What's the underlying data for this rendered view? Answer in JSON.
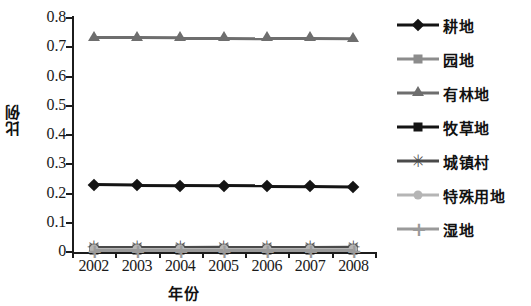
{
  "chart_data": {
    "type": "line",
    "title": "",
    "xlabel": "年份",
    "ylabel": "比例",
    "categories": [
      "2002",
      "2003",
      "2004",
      "2005",
      "2006",
      "2007",
      "2008"
    ],
    "x": [
      2002,
      2003,
      2004,
      2005,
      2006,
      2007,
      2008
    ],
    "ylim": [
      0,
      0.8
    ],
    "yticks": [
      "0",
      "0.1",
      "0.2",
      "0.3",
      "0.4",
      "0.5",
      "0.6",
      "0.7",
      "0.8"
    ],
    "ytick_values": [
      0,
      0.1,
      0.2,
      0.3,
      0.4,
      0.5,
      0.6,
      0.7,
      0.8
    ],
    "grid": false,
    "legend_position": "right",
    "series": [
      {
        "name": "耕地",
        "marker": "diamond",
        "color": "#141414",
        "line_color": "#141414",
        "values": [
          0.23,
          0.228,
          0.227,
          0.226,
          0.225,
          0.224,
          0.222
        ]
      },
      {
        "name": "园地",
        "marker": "square",
        "color": "#8c8c8c",
        "line_color": "#8c8c8c",
        "values": [
          0.012,
          0.012,
          0.012,
          0.012,
          0.012,
          0.012,
          0.012
        ]
      },
      {
        "name": "有林地",
        "marker": "triangle",
        "color": "#6e6e6e",
        "line_color": "#6e6e6e",
        "values": [
          0.732,
          0.732,
          0.731,
          0.731,
          0.73,
          0.73,
          0.729
        ]
      },
      {
        "name": "牧草地",
        "marker": "square",
        "color": "#141414",
        "line_color": "#141414",
        "values": [
          0.006,
          0.006,
          0.006,
          0.006,
          0.006,
          0.006,
          0.006
        ]
      },
      {
        "name": "城镇村",
        "marker": "star",
        "color": "#4a4a4a",
        "line_color": "#4a4a4a",
        "values": [
          0.016,
          0.016,
          0.016,
          0.017,
          0.017,
          0.017,
          0.018
        ]
      },
      {
        "name": "特殊用地",
        "marker": "circle",
        "color": "#b5b5b5",
        "line_color": "#b5b5b5",
        "values": [
          0.009,
          0.009,
          0.009,
          0.009,
          0.009,
          0.009,
          0.009
        ]
      },
      {
        "name": "湿地",
        "marker": "plus",
        "color": "#9a9a9a",
        "line_color": "#9a9a9a",
        "values": [
          0.004,
          0.004,
          0.004,
          0.004,
          0.004,
          0.004,
          0.004
        ]
      }
    ]
  },
  "axes": {
    "y_title": "比例",
    "x_title": "年份"
  }
}
